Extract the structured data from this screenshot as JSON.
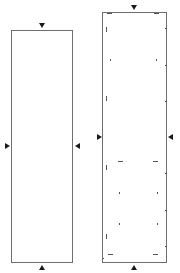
{
  "diagram": {
    "panels": [
      {
        "id": "left-panel",
        "box": {
          "x": 11,
          "y": 30,
          "w": 62,
          "h": 233
        },
        "arrows": [
          {
            "dir": "down",
            "x": 39,
            "y": 23
          },
          {
            "dir": "right",
            "x": 5,
            "y": 143
          },
          {
            "dir": "left",
            "x": 75,
            "y": 143
          },
          {
            "dir": "up",
            "x": 39,
            "y": 265
          }
        ]
      },
      {
        "id": "right-panel",
        "box": {
          "x": 102,
          "y": 12,
          "w": 65,
          "h": 251
        },
        "arrows": [
          {
            "dir": "down",
            "x": 131,
            "y": 5
          },
          {
            "dir": "right",
            "x": 97,
            "y": 134
          },
          {
            "dir": "left",
            "x": 168,
            "y": 134
          },
          {
            "dir": "up",
            "x": 131,
            "y": 265
          }
        ],
        "marks": [
          {
            "x": 107,
            "y": 13,
            "w": 5,
            "h": 1
          },
          {
            "x": 154,
            "y": 13,
            "w": 5,
            "h": 1
          },
          {
            "x": 106,
            "y": 27,
            "w": 1,
            "h": 5
          },
          {
            "x": 165,
            "y": 28,
            "w": 2,
            "h": 1
          },
          {
            "x": 110,
            "y": 59,
            "w": 1,
            "h": 2
          },
          {
            "x": 156,
            "y": 59,
            "w": 1,
            "h": 2
          },
          {
            "x": 165,
            "y": 65,
            "w": 2,
            "h": 1
          },
          {
            "x": 106,
            "y": 96,
            "w": 1,
            "h": 5
          },
          {
            "x": 165,
            "y": 101,
            "w": 2,
            "h": 1
          },
          {
            "x": 118,
            "y": 161,
            "w": 5,
            "h": 1
          },
          {
            "x": 153,
            "y": 161,
            "w": 5,
            "h": 1
          },
          {
            "x": 106,
            "y": 165,
            "w": 1,
            "h": 5
          },
          {
            "x": 165,
            "y": 173,
            "w": 2,
            "h": 1
          },
          {
            "x": 119,
            "y": 192,
            "w": 1,
            "h": 2
          },
          {
            "x": 157,
            "y": 192,
            "w": 1,
            "h": 2
          },
          {
            "x": 165,
            "y": 210,
            "w": 2,
            "h": 1
          },
          {
            "x": 119,
            "y": 223,
            "w": 1,
            "h": 2
          },
          {
            "x": 157,
            "y": 223,
            "w": 1,
            "h": 2
          },
          {
            "x": 106,
            "y": 234,
            "w": 1,
            "h": 5
          },
          {
            "x": 165,
            "y": 246,
            "w": 2,
            "h": 1
          },
          {
            "x": 108,
            "y": 254,
            "w": 5,
            "h": 1
          },
          {
            "x": 153,
            "y": 254,
            "w": 5,
            "h": 1
          },
          {
            "x": 103,
            "y": 258,
            "w": 1,
            "h": 1
          }
        ]
      }
    ],
    "colors": {
      "border": "#6e6e6e",
      "arrow": "#1a1a1a",
      "mark": "#555555"
    }
  }
}
